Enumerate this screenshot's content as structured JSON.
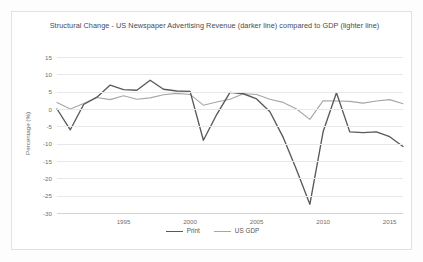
{
  "chart_data": {
    "type": "line",
    "title": "Structural Change - US Newspaper Advertising Revenue (darker line) compared to GDP (lighter line)",
    "xlabel": "",
    "ylabel": "Percentage (%)",
    "ylim": [
      -30,
      15
    ],
    "xlim": [
      1990,
      2016
    ],
    "grid": true,
    "legend_position": "bottom",
    "ytick_labels": [
      "15",
      "10",
      "5",
      "0",
      "-5",
      "-10",
      "-15",
      "-20",
      "-25",
      "-30"
    ],
    "ytick_values": [
      15,
      10,
      5,
      0,
      -5,
      -10,
      -15,
      -20,
      -25,
      -30
    ],
    "xtick_labels": [
      "1995",
      "2000",
      "2005",
      "2010",
      "2015"
    ],
    "xtick_values": [
      1995,
      2000,
      2005,
      2010,
      2015
    ],
    "x": [
      1990,
      1991,
      1992,
      1993,
      1994,
      1995,
      1996,
      1997,
      1998,
      1999,
      2000,
      2001,
      2002,
      2003,
      2004,
      2005,
      2006,
      2007,
      2008,
      2009,
      2010,
      2011,
      2012,
      2013,
      2014,
      2015,
      2016
    ],
    "series": [
      {
        "name": "Print",
        "color": "#595959",
        "values": [
          0.0,
          -6.0,
          1.3,
          3.4,
          6.9,
          5.6,
          5.4,
          8.3,
          5.7,
          5.2,
          5.1,
          -9.0,
          -1.6,
          4.8,
          4.4,
          2.9,
          -0.8,
          -8.2,
          -17.5,
          -27.5,
          -6.5,
          4.7,
          -6.6,
          -6.8,
          -6.6,
          -8.0,
          -10.8
        ]
      },
      {
        "name": "US GDP",
        "color": "#a6a6a6",
        "values": [
          1.9,
          0.0,
          1.6,
          3.3,
          2.7,
          3.8,
          2.8,
          3.2,
          4.1,
          4.5,
          4.2,
          1.1,
          2.0,
          2.8,
          4.4,
          4.2,
          2.8,
          1.9,
          0.0,
          -3.0,
          2.4,
          2.3,
          2.2,
          1.7,
          2.3,
          2.7,
          1.5
        ]
      }
    ]
  },
  "legend": {
    "items": [
      {
        "label": "Print",
        "color": "#595959"
      },
      {
        "label": "US GDP",
        "color": "#a6a6a6"
      }
    ]
  }
}
